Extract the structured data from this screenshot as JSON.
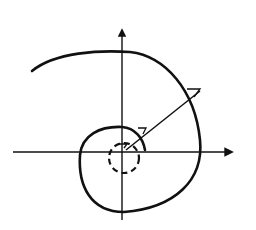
{
  "diagram": {
    "type": "spiral-in-polar-axes",
    "colors": {
      "background": "#ffffff",
      "stroke": "#111111"
    },
    "axes": {
      "horizontal": {
        "x1": 13,
        "y": 152,
        "x2": 232,
        "arrow": true
      },
      "vertical": {
        "x": 122,
        "y1": 220,
        "y2": 30,
        "arrow": true
      }
    },
    "origin": {
      "x": 124,
      "y": 152
    },
    "spiral_path": "M 32 71 C 55 52, 100 50, 130 52 C 165 56, 195 90, 200 140 C 204 180, 175 208, 124 212 C 90 212, 78 185, 80 155 C 82 135, 100 126, 122 127 C 135 128, 143 138, 145 150",
    "dashed_circle": {
      "cx": 124,
      "cy": 158,
      "r": 15
    },
    "radius_line": {
      "x1": 126,
      "y1": 150,
      "x2": 200,
      "y2": 91
    },
    "angle_markers": [
      {
        "points": "187,89 200,89 194,97"
      },
      {
        "points": "138,128 146,128 143,134"
      },
      {
        "points": "118,144 127,144 124,148"
      }
    ]
  }
}
